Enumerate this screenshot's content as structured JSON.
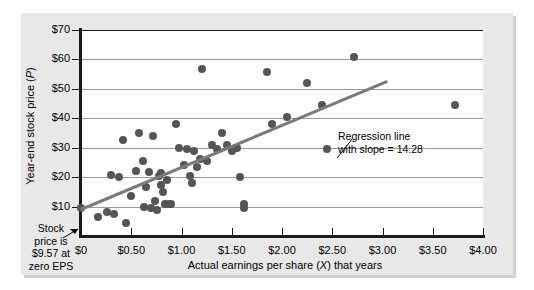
{
  "chart_data": {
    "type": "scatter",
    "title": "",
    "xlabel": "Actual earnings per share (X) that years",
    "ylabel": "Year-end stock price (P)",
    "xlim": [
      0,
      4.0
    ],
    "ylim": [
      0,
      70
    ],
    "grid": "horizontal",
    "legend": "none",
    "x_ticks": [
      0,
      0.5,
      1.0,
      1.5,
      2.0,
      2.5,
      3.0,
      3.5,
      4.0
    ],
    "x_tick_labels": [
      "$0",
      "$0.50",
      "$1.00",
      "$1.50",
      "$2.00",
      "$2.50",
      "$3.00",
      "$3.50",
      "$4.00"
    ],
    "y_ticks": [
      10,
      20,
      30,
      40,
      50,
      60,
      70
    ],
    "y_tick_labels": [
      "$10",
      "$20",
      "$30",
      "$40",
      "$50",
      "$60",
      "$70"
    ],
    "series": [
      {
        "name": "Observations",
        "marker": "circle",
        "color": "#555555",
        "points": [
          [
            0.0,
            9.57
          ],
          [
            0.17,
            6.3
          ],
          [
            0.26,
            8.0
          ],
          [
            0.33,
            7.6
          ],
          [
            0.3,
            20.8
          ],
          [
            0.38,
            20.0
          ],
          [
            0.42,
            32.5
          ],
          [
            0.45,
            4.3
          ],
          [
            0.5,
            13.5
          ],
          [
            0.55,
            22.0
          ],
          [
            0.58,
            35.0
          ],
          [
            0.62,
            25.5
          ],
          [
            0.63,
            10.0
          ],
          [
            0.65,
            16.5
          ],
          [
            0.68,
            21.8
          ],
          [
            0.7,
            9.5
          ],
          [
            0.72,
            34.0
          ],
          [
            0.74,
            12.0
          ],
          [
            0.76,
            8.8
          ],
          [
            0.78,
            20.5
          ],
          [
            0.8,
            21.3
          ],
          [
            0.8,
            17.5
          ],
          [
            0.82,
            15.0
          ],
          [
            0.84,
            11.0
          ],
          [
            0.86,
            19.0
          ],
          [
            0.88,
            10.8
          ],
          [
            0.9,
            11.0
          ],
          [
            0.95,
            38.0
          ],
          [
            0.98,
            30.0
          ],
          [
            1.02,
            24.0
          ],
          [
            1.05,
            29.5
          ],
          [
            1.08,
            20.3
          ],
          [
            1.1,
            18.0
          ],
          [
            1.12,
            29.0
          ],
          [
            1.15,
            23.5
          ],
          [
            1.18,
            26.0
          ],
          [
            1.2,
            56.8
          ],
          [
            1.25,
            25.5
          ],
          [
            1.3,
            30.8
          ],
          [
            1.35,
            29.5
          ],
          [
            1.4,
            35.0
          ],
          [
            1.45,
            31.0
          ],
          [
            1.5,
            29.0
          ],
          [
            1.55,
            30.0
          ],
          [
            1.58,
            20.0
          ],
          [
            1.62,
            11.0
          ],
          [
            1.62,
            9.5
          ],
          [
            1.85,
            55.8
          ],
          [
            1.9,
            38.0
          ],
          [
            2.05,
            40.5
          ],
          [
            2.25,
            52.0
          ],
          [
            2.4,
            44.5
          ],
          [
            2.45,
            29.5
          ],
          [
            2.72,
            60.8
          ],
          [
            3.72,
            44.5
          ]
        ]
      }
    ],
    "regression": {
      "label_line_1": "Regression line",
      "label_line_2": "with slope = 14.28",
      "slope": 14.28,
      "intercept": 9.57,
      "color": "#7a7a7a",
      "x_start": 0.0,
      "x_end": 3.05
    },
    "annotations": [
      {
        "name": "intercept-note",
        "text_lines": [
          "Stock",
          "price is",
          "$9.57 at",
          "zero EPS"
        ],
        "points_to_x": 0.0,
        "points_to_y": 9.57
      },
      {
        "name": "regression-note",
        "text_lines": [
          "Regression line",
          "with slope = 14.28"
        ]
      }
    ]
  },
  "axis": {
    "y_title_prefix": "Year-end stock price (",
    "y_title_var": "P",
    "y_title_suffix": ")",
    "x_title_prefix": "Actual earnings per share (",
    "x_title_var": "X",
    "x_title_suffix": ") that years"
  },
  "annot": {
    "stock_l1": "Stock",
    "stock_l2": "price is",
    "stock_l3": "$9.57 at",
    "stock_l4": "zero EPS",
    "reg_l1": "Regression line",
    "reg_l2": "with slope = 14.28"
  }
}
